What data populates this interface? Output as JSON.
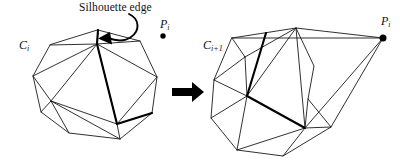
{
  "figure": {
    "domain": "diagram",
    "caption_text": "Silhouette edge",
    "background_color": "#ffffff",
    "ink_color": "#1a1a1a",
    "highlight_color": "#000000",
    "width": 419,
    "height": 167
  },
  "annotations": {
    "silhouette_label": "Silhouette edge",
    "curved_pointer_icon": "curved-arrow-icon",
    "transition_icon": "right-arrow-icon"
  },
  "left_panel": {
    "hull_label_base": "C",
    "hull_label_sub": "i",
    "point_label_base": "P",
    "point_label_sub": "i",
    "point_marker_icon": "filled-dot-icon",
    "description": "Convex hull C_i with highlighted silhouette edges and external point P_i"
  },
  "right_panel": {
    "hull_label_base": "C",
    "hull_label_sub": "i+1",
    "point_label_base": "P",
    "point_label_sub": "i",
    "point_marker_icon": "filled-dot-icon",
    "description": "Updated convex hull C_i+1 after incorporating point P_i"
  },
  "geometry": {
    "left_hull_outline": "M 98,30 L 140,41 L 157,77 L 152,113 L 120,139 L 69,133 L 41,112 L 33,76 L 50,45 Z",
    "left_inner_edges": [
      "M 98,30 L 97,44",
      "M 50,45 L 97,44",
      "M 140,41 L 97,44",
      "M 33,76 L 97,44",
      "M 33,76 L 51,101",
      "M 51,101 L 97,44",
      "M 51,101 L 41,112",
      "M 51,101 L 69,133",
      "M 51,101 L 120,139",
      "M 51,101 L 117,124",
      "M 97,44 L 117,124",
      "M 117,124 L 120,139",
      "M 117,124 L 152,113",
      "M 117,124 L 157,77",
      "M 97,44 L 157,77",
      "M 140,41 L 157,77"
    ],
    "left_silhouette_edges": [
      "M 98,30 L 97,44",
      "M 97,44 L 117,124",
      "M 117,124 L 152,113"
    ],
    "left_apex": {
      "x": 163,
      "y": 36,
      "r": 2.7
    },
    "right_hull_outline": "M 232,38 L 296,28 L 314,66 L 308,99 L 331,127 L 283,156 L 237,150 L 211,118 L 214,80 Z",
    "right_inner_edges": [
      "M 232,38 L 245,57",
      "M 214,80 L 245,57",
      "M 296,28 L 245,57",
      "M 245,57 L 247,96",
      "M 214,80 L 247,96",
      "M 211,118 L 247,96",
      "M 237,150 L 247,96",
      "M 247,96 L 305,128",
      "M 247,96 L 296,28",
      "M 296,28 L 305,128",
      "M 305,128 L 331,127",
      "M 305,128 L 283,156",
      "M 237,150 L 305,128",
      "M 296,28 L 314,66",
      "M 314,66 L 308,99",
      "M 308,99 L 305,128"
    ],
    "right_silhouette_edges": [
      "M 247,96 L 305,128",
      "M 266,33 L 247,96"
    ],
    "right_cone_edges": [
      "M 383,38 L 232,38",
      "M 383,38 L 296,28",
      "M 383,38 L 305,128",
      "M 383,38 L 331,127"
    ],
    "right_apex": {
      "x": 383,
      "y": 38,
      "r": 3.4
    },
    "block_arrow": "M 172,88 L 192,88 L 192,83 L 203,92 L 192,101 L 192,96 L 172,96 Z",
    "curved_pointer": "M 129,14 C 140,19 140,31 131,37 C 124,42 116,41 108,38",
    "curved_pointer_head": "M 110,33 L 99,38.5 L 111,44 Z"
  }
}
